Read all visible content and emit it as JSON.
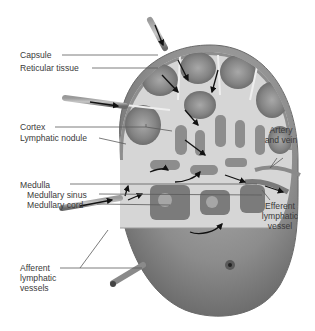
{
  "diagram": {
    "colors": {
      "background": "#ffffff",
      "capsule": "#8e8e8e",
      "tissue_dark": "#7d7d7d",
      "tissue_light": "#d9d9d9",
      "nodule_center": "#a5a5a5",
      "outer_body": "#8a8a8a",
      "label_text": "#3a3a3a",
      "leader_line": "#5a5a5a",
      "arrow": "#111111"
    },
    "labels": {
      "capsule": "Capsule",
      "reticular_tissue": "Reticular tissue",
      "cortex": "Cortex",
      "lymphatic_nodule": "Lymphatic nodule",
      "artery_and_vein_line1": "Artery",
      "artery_and_vein_line2": "and vein",
      "medulla": "Medulla",
      "medullary_sinus": "Medullary sinus",
      "medullary_cord": "Medullary cord",
      "efferent_line1": "Efferent",
      "efferent_line2": "lymphatic",
      "efferent_line3": "vessel",
      "afferent_line1": "Afferent",
      "afferent_line2": "lymphatic",
      "afferent_line3": "vessels"
    }
  }
}
